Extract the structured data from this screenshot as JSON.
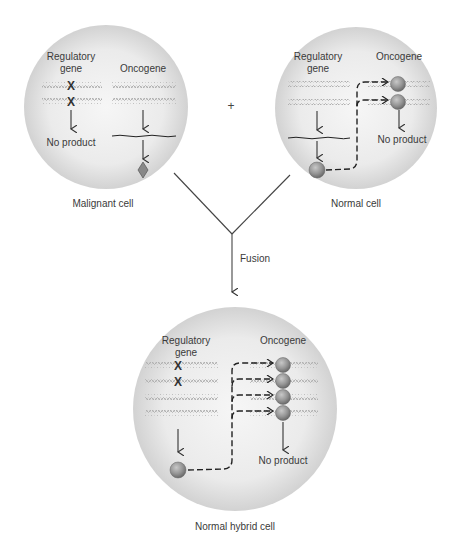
{
  "diagram": {
    "title": "",
    "plus_sign": "+",
    "fusion_label": "Fusion",
    "cells": {
      "malignant": {
        "caption": "Malignant cell",
        "regulatory_label_1": "Regulatory",
        "regulatory_label_2": "gene",
        "oncogene_label": "Oncogene",
        "regulatory_result": "No product",
        "regulatory_mutated": true,
        "oncogene_product": "diamond (oncoprotein)"
      },
      "normal": {
        "caption": "Normal cell",
        "regulatory_label_1": "Regulatory",
        "regulatory_label_2": "gene",
        "oncogene_label": "Oncogene",
        "oncogene_result": "No product",
        "repressor_count": 2
      },
      "hybrid": {
        "caption": "Normal hybrid cell",
        "regulatory_label_1": "Regulatory",
        "regulatory_label_2": "gene",
        "oncogene_label": "Oncogene",
        "oncogene_result": "No product",
        "repressor_count": 4,
        "mutated_regulatory_copies": 2,
        "normal_regulatory_copies": 2
      }
    },
    "colors": {
      "cell_center": "#f4f4f4",
      "cell_edge": "#cfcfcf",
      "repressor": "#8a8a8a",
      "text": "#3a3a3a"
    }
  }
}
